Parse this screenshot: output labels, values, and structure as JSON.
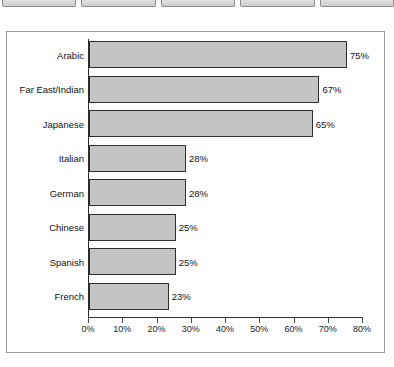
{
  "top_strip": {
    "boxes": [
      {
        "name": "toolbar-box-1"
      },
      {
        "name": "toolbar-box-2"
      },
      {
        "name": "toolbar-box-3"
      },
      {
        "name": "toolbar-box-4"
      },
      {
        "name": "toolbar-box-5"
      }
    ]
  },
  "caption": {
    "ghost_text": ""
  },
  "colors": {
    "bar_fill": "#c4c4c4",
    "bar_border": "#2f2f2f",
    "axis": "#2b2b2b",
    "frame_border": "#9a9a9a",
    "text": "#111111"
  },
  "chart_data": {
    "type": "bar",
    "orientation": "horizontal",
    "title": "",
    "xlabel": "",
    "ylabel": "",
    "grid": false,
    "legend": "none",
    "xlim": [
      0,
      80
    ],
    "categories": [
      "Arabic",
      "Far East/Indian",
      "Japanese",
      "Italian",
      "German",
      "Chinese",
      "Spanish",
      "French"
    ],
    "values": [
      75,
      67,
      65,
      28,
      28,
      25,
      25,
      23
    ],
    "value_labels": [
      "75%",
      "67%",
      "65%",
      "28%",
      "28%",
      "25%",
      "25%",
      "23%"
    ],
    "xticks": [
      0,
      10,
      20,
      30,
      40,
      50,
      60,
      70,
      80
    ],
    "xtick_labels": [
      "0%",
      "10%",
      "20%",
      "30%",
      "40%",
      "50%",
      "60%",
      "70%",
      "80%"
    ]
  }
}
